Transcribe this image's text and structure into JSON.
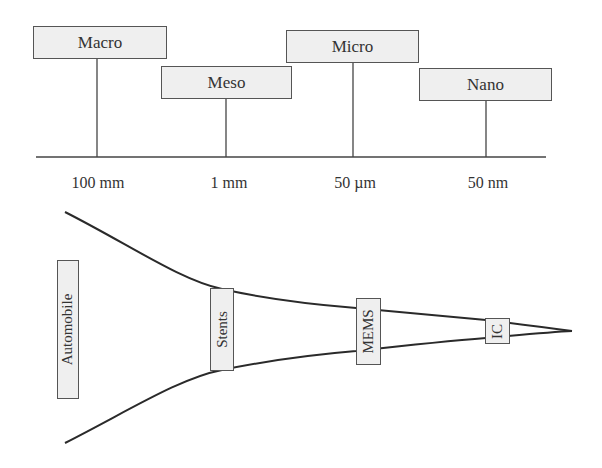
{
  "scales": [
    {
      "label": "Macro",
      "dimension": "100 mm"
    },
    {
      "label": "Meso",
      "dimension": "1 mm"
    },
    {
      "label": "Micro",
      "dimension": "50 µm"
    },
    {
      "label": "Nano",
      "dimension": "50 nm"
    }
  ],
  "examples": [
    {
      "label": "Automobile"
    },
    {
      "label": "Stents"
    },
    {
      "label": "MEMS"
    },
    {
      "label": "IC"
    }
  ],
  "colors": {
    "box_fill": "#efefef",
    "line": "#2a2a2a"
  }
}
